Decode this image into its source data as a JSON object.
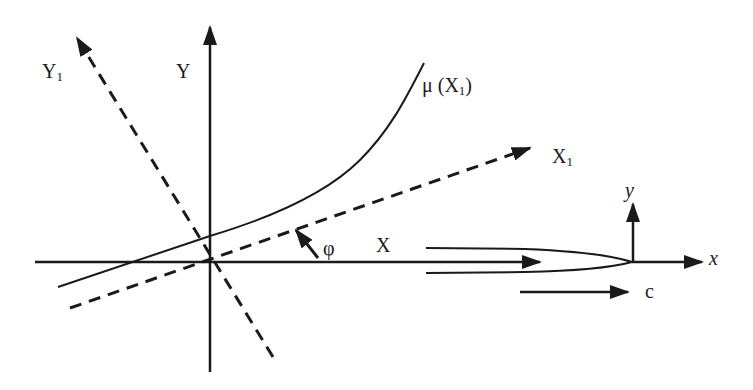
{
  "diagram": {
    "colors": {
      "stroke": "#1a1a1a",
      "background": "#ffffff"
    },
    "labels": {
      "Y_axis": "Y",
      "Y1_axis": "Y",
      "Y1_sub": "1",
      "X_axis": "X",
      "X1_axis": "X",
      "X1_sub": "1",
      "mu_prefix": "μ (X",
      "mu_sub": "1",
      "mu_suffix": ")",
      "angle": "φ",
      "local_y": "y",
      "local_x": "x",
      "crack_speed": "c"
    },
    "elements": [
      "global X axis (solid arrow)",
      "global Y axis (solid arrow)",
      "rotated X1 axis (dashed arrow)",
      "rotated Y1 axis (dashed arrow)",
      "interface curve μ(X1)",
      "rotation angle φ arrow",
      "crack faces converging to tip",
      "local x-y axes at crack tip",
      "crack propagation speed c arrow"
    ]
  }
}
